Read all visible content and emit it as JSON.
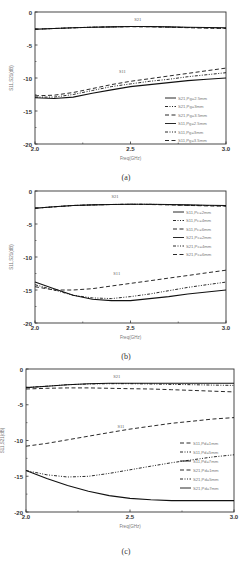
{
  "figure": {
    "captions": [
      "(a)",
      "(b)",
      "(c)"
    ]
  },
  "chart_data": [
    {
      "type": "line",
      "panel": "(a)",
      "xlabel": "Freq(GHz)",
      "ylabel": "S11,S21(dB)",
      "xlim": [
        2.0,
        3.0
      ],
      "ylim": [
        -20,
        0
      ],
      "xticks": [
        "2.0",
        "2.5",
        "3.0"
      ],
      "yticks": [
        "0",
        "-5",
        "-10",
        "-15",
        "-20"
      ],
      "annotations": [
        {
          "text": "S21",
          "x": 2.52,
          "y": -1.3
        },
        {
          "text": "S11",
          "x": 2.44,
          "y": -9.2
        }
      ],
      "legend_position": "lower right",
      "x": [
        2.0,
        2.1,
        2.2,
        2.3,
        2.4,
        2.5,
        2.6,
        2.7,
        2.8,
        2.9,
        3.0
      ],
      "series": [
        {
          "name": "S21,Pg=2.5mm",
          "style": "solid",
          "values": [
            -2.6,
            -2.5,
            -2.4,
            -2.3,
            -2.25,
            -2.2,
            -2.2,
            -2.25,
            -2.3,
            -2.35,
            -2.4
          ]
        },
        {
          "name": "S21,Pg=3mm",
          "style": "dashdot",
          "values": [
            -2.6,
            -2.5,
            -2.4,
            -2.3,
            -2.25,
            -2.2,
            -2.22,
            -2.28,
            -2.35,
            -2.4,
            -2.45
          ]
        },
        {
          "name": "S21,Pg=3.5mm",
          "style": "dash",
          "values": [
            -2.6,
            -2.5,
            -2.4,
            -2.3,
            -2.25,
            -2.22,
            -2.25,
            -2.3,
            -2.38,
            -2.45,
            -2.5
          ]
        },
        {
          "name": "S11,Pg=2.5mm",
          "style": "solid",
          "values": [
            -13.0,
            -13.1,
            -12.9,
            -12.3,
            -11.8,
            -11.3,
            -11.0,
            -10.7,
            -10.4,
            -10.2,
            -10.0
          ]
        },
        {
          "name": "S11,Pg=3mm",
          "style": "dashdot",
          "values": [
            -12.9,
            -12.9,
            -12.5,
            -11.9,
            -11.3,
            -10.9,
            -10.5,
            -10.2,
            -9.8,
            -9.5,
            -9.2
          ]
        },
        {
          "name": "S11,Pg=3.5mm",
          "style": "dash",
          "values": [
            -12.7,
            -12.6,
            -12.2,
            -11.6,
            -11.0,
            -10.5,
            -10.1,
            -9.7,
            -9.3,
            -8.9,
            -8.5
          ]
        }
      ],
      "legend": [
        "S21,Pg=2.5mm",
        "S21,Pg=3mm",
        "S21,Pg=3.5mm",
        "S11,Pg=2.5mm",
        "S11,Pg=3mm",
        "S11,Pg=3.5mm"
      ],
      "legend_styles": [
        "solid",
        "dashdot",
        "dash",
        "solid",
        "dashdot",
        "dash"
      ]
    },
    {
      "type": "line",
      "panel": "(b)",
      "xlabel": "Freq(GHz)",
      "ylabel": "S11,S21(dB)",
      "xlim": [
        2.0,
        3.0
      ],
      "ylim": [
        -20,
        0
      ],
      "xticks": [
        "2.0",
        "2.5",
        "3.0"
      ],
      "yticks": [
        "0",
        "-5",
        "-10",
        "-15",
        "-20"
      ],
      "annotations": [
        {
          "text": "S21",
          "x": 2.4,
          "y": -1.1
        },
        {
          "text": "S11",
          "x": 2.41,
          "y": -12.8
        }
      ],
      "legend_position": "upper right",
      "x": [
        2.0,
        2.1,
        2.2,
        2.3,
        2.4,
        2.5,
        2.6,
        2.7,
        2.8,
        2.9,
        3.0
      ],
      "series": [
        {
          "name": "S21,Pc=2mm",
          "style": "solid",
          "values": [
            -2.6,
            -2.4,
            -2.2,
            -2.1,
            -2.05,
            -2.0,
            -2.0,
            -2.05,
            -2.1,
            -2.15,
            -2.2
          ]
        },
        {
          "name": "S21,Pc=4mm",
          "style": "dashdot",
          "values": [
            -2.6,
            -2.4,
            -2.2,
            -2.1,
            -2.05,
            -2.0,
            -2.02,
            -2.08,
            -2.15,
            -2.2,
            -2.25
          ]
        },
        {
          "name": "S21,Pc=6mm",
          "style": "dash",
          "values": [
            -2.6,
            -2.4,
            -2.2,
            -2.1,
            -2.05,
            -2.02,
            -2.05,
            -2.1,
            -2.18,
            -2.25,
            -2.3
          ]
        },
        {
          "name": "S11,Pc=2mm",
          "style": "solid",
          "values": [
            -13.8,
            -14.8,
            -15.8,
            -16.4,
            -16.6,
            -16.6,
            -16.3,
            -16.0,
            -15.6,
            -15.3,
            -15.0
          ]
        },
        {
          "name": "S11,Pc=4mm",
          "style": "dashdot",
          "values": [
            -14.2,
            -15.0,
            -15.8,
            -16.2,
            -16.3,
            -16.0,
            -15.6,
            -15.1,
            -14.6,
            -14.2,
            -13.8
          ]
        },
        {
          "name": "S11,Pc=6mm",
          "style": "dash",
          "values": [
            -14.5,
            -15.0,
            -15.0,
            -14.8,
            -14.4,
            -14.0,
            -13.6,
            -13.2,
            -12.8,
            -12.4,
            -12.0
          ]
        }
      ],
      "legend": [
        "S11,Pc=2mm",
        "S11,Pc=4mm",
        "S11,Pc=6mm",
        "S21,Pc=2mm",
        "S21,Pc=4mm",
        "S21,Pc=6mm"
      ],
      "legend_styles": [
        "solid",
        "dashdot",
        "dash",
        "solid",
        "dashdot",
        "dash"
      ]
    },
    {
      "type": "line",
      "panel": "(c)",
      "xlabel": "Freq(GHz)",
      "ylabel": "S11,S21(dB)",
      "xlim": [
        2.0,
        3.0
      ],
      "ylim": [
        -20,
        0
      ],
      "xticks": [
        "2.0",
        "2.5",
        "3.0"
      ],
      "yticks": [
        "0",
        "-5",
        "-10",
        "-15",
        "-20"
      ],
      "annotations": [
        {
          "text": "S21",
          "x": 2.42,
          "y": -1.2
        },
        {
          "text": "S11",
          "x": 2.44,
          "y": -8.2
        }
      ],
      "legend_position": "lower right",
      "x": [
        2.0,
        2.1,
        2.2,
        2.3,
        2.4,
        2.5,
        2.6,
        2.7,
        2.8,
        2.9,
        3.0
      ],
      "series": [
        {
          "name": "S21,Pd=1mm",
          "style": "dash",
          "values": [
            -2.8,
            -2.7,
            -2.65,
            -2.65,
            -2.7,
            -2.75,
            -2.8,
            -2.9,
            -3.0,
            -3.1,
            -3.2
          ]
        },
        {
          "name": "S21,Pd=5mm",
          "style": "dashdot",
          "values": [
            -2.6,
            -2.4,
            -2.2,
            -2.1,
            -2.05,
            -2.05,
            -2.1,
            -2.15,
            -2.2,
            -2.25,
            -2.3
          ]
        },
        {
          "name": "S21,Pd=7mm",
          "style": "solid",
          "values": [
            -2.6,
            -2.4,
            -2.2,
            -2.05,
            -2.0,
            -2.0,
            -2.0,
            -2.0,
            -2.0,
            -2.0,
            -2.0
          ]
        },
        {
          "name": "S11,Pd=1mm",
          "style": "dash",
          "values": [
            -10.8,
            -10.4,
            -9.9,
            -9.4,
            -8.9,
            -8.4,
            -8.0,
            -7.6,
            -7.3,
            -7.0,
            -6.8
          ]
        },
        {
          "name": "S11,Pd=5mm",
          "style": "dashdot",
          "values": [
            -14.2,
            -14.8,
            -15.1,
            -15.0,
            -14.6,
            -14.1,
            -13.6,
            -13.1,
            -12.7,
            -12.3,
            -12.0
          ]
        },
        {
          "name": "S11,Pd=7mm",
          "style": "solid",
          "values": [
            -14.2,
            -15.3,
            -16.3,
            -17.1,
            -17.7,
            -18.1,
            -18.3,
            -18.4,
            -18.4,
            -18.4,
            -18.4
          ]
        }
      ],
      "legend": [
        "S11,Pd=1mm",
        "S11,Pd=5mm",
        "S11,Pd=7mm",
        "S21,Pd=1mm",
        "S21,Pd=5mm",
        "S21,Pd=7mm"
      ],
      "legend_styles": [
        "dash",
        "dashdot",
        "solid",
        "dash",
        "dashdot",
        "solid"
      ]
    }
  ]
}
